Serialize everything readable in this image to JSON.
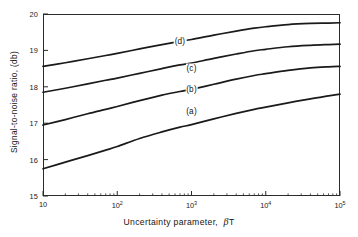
{
  "chart_data": {
    "type": "line",
    "title": "",
    "xlabel": "Uncertainty parameter,  βT",
    "ylabel": "Signal-to-noise ratio,  (db)",
    "xscale": "log",
    "xlim": [
      10,
      100000
    ],
    "ylim": [
      15,
      20
    ],
    "grid": false,
    "legend": "inline-curve-labels",
    "xticks": [
      {
        "value": 10,
        "label": "10",
        "mantissa": "10",
        "exponent": ""
      },
      {
        "value": 100,
        "label": "10^2",
        "mantissa": "10",
        "exponent": "2"
      },
      {
        "value": 1000,
        "label": "10^3",
        "mantissa": "10",
        "exponent": "3"
      },
      {
        "value": 10000,
        "label": "10^4",
        "mantissa": "10",
        "exponent": "4"
      },
      {
        "value": 100000,
        "label": "10^5",
        "mantissa": "10",
        "exponent": "5"
      }
    ],
    "yticks": [
      {
        "value": 15,
        "label": "15"
      },
      {
        "value": 16,
        "label": "16"
      },
      {
        "value": 17,
        "label": "17"
      },
      {
        "value": 18,
        "label": "18"
      },
      {
        "value": 19,
        "label": "19"
      },
      {
        "value": 20,
        "label": "20"
      }
    ],
    "line_color": "#1a1a1a",
    "series": [
      {
        "name": "(a)",
        "label": "(a)",
        "label_at": {
          "x": 1000,
          "y": 17.33
        },
        "x": [
          10,
          20,
          40,
          70,
          100,
          200,
          400,
          700,
          1000,
          2000,
          4000,
          7000,
          10000,
          20000,
          40000,
          70000,
          100000
        ],
        "values": [
          15.75,
          15.93,
          16.11,
          16.26,
          16.36,
          16.58,
          16.76,
          16.89,
          16.96,
          17.12,
          17.27,
          17.38,
          17.44,
          17.56,
          17.67,
          17.75,
          17.8
        ]
      },
      {
        "name": "(b)",
        "label": "(b)",
        "label_at": {
          "x": 1000,
          "y": 17.93
        },
        "x": [
          10,
          20,
          40,
          70,
          100,
          200,
          400,
          700,
          1000,
          2000,
          4000,
          7000,
          10000,
          20000,
          40000,
          70000,
          100000
        ],
        "values": [
          16.95,
          17.1,
          17.26,
          17.38,
          17.46,
          17.62,
          17.77,
          17.87,
          17.93,
          18.07,
          18.21,
          18.31,
          18.36,
          18.45,
          18.52,
          18.55,
          18.56
        ]
      },
      {
        "name": "(c)",
        "label": "(c)",
        "label_at": {
          "x": 1000,
          "y": 18.52
        },
        "x": [
          10,
          20,
          40,
          70,
          100,
          200,
          400,
          700,
          1000,
          2000,
          4000,
          7000,
          10000,
          20000,
          40000,
          70000,
          100000
        ],
        "values": [
          17.85,
          17.96,
          18.08,
          18.18,
          18.24,
          18.37,
          18.5,
          18.6,
          18.65,
          18.78,
          18.9,
          18.99,
          19.03,
          19.1,
          19.14,
          19.16,
          19.17
        ]
      },
      {
        "name": "(d)",
        "label": "(d)",
        "label_at": {
          "x": 700,
          "y": 19.26
        },
        "x": [
          10,
          20,
          40,
          70,
          100,
          200,
          400,
          700,
          1000,
          2000,
          4000,
          7000,
          10000,
          20000,
          40000,
          70000,
          100000
        ],
        "values": [
          18.56,
          18.66,
          18.77,
          18.86,
          18.92,
          19.04,
          19.16,
          19.25,
          19.3,
          19.42,
          19.53,
          19.61,
          19.65,
          19.71,
          19.74,
          19.75,
          19.76
        ]
      }
    ]
  }
}
